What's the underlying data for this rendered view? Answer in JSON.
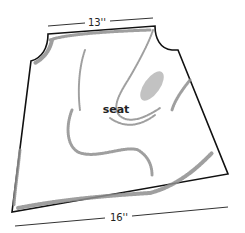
{
  "diagram": {
    "part_label": "seat",
    "top_dimension": "13''",
    "bottom_dimension": "16''",
    "colors": {
      "outline": "#111111",
      "shading": "#9a9a9a",
      "background": "#ffffff"
    }
  }
}
